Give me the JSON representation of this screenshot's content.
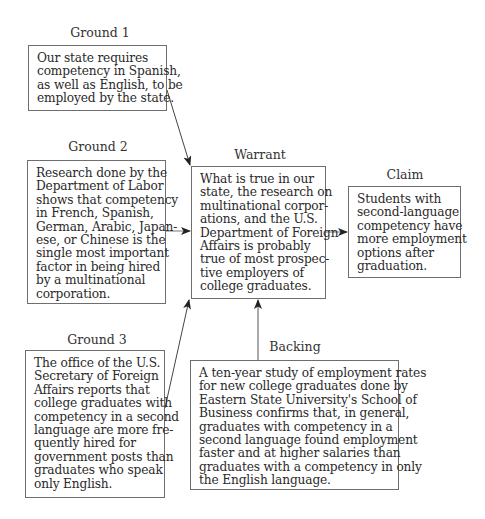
{
  "diagram": {
    "ground1": {
      "label": "Ground 1",
      "lines": [
        "Our state requires",
        "competency in Spanish,",
        "as well as English, to be",
        "employed by the state."
      ]
    },
    "ground2": {
      "label": "Ground 2",
      "lines": [
        "Research done by the",
        "Department of Labor",
        "shows that competency",
        "in French, Spanish,",
        "German, Arabic, Japan-",
        "ese, or Chinese is the",
        "single most important",
        "factor in being hired",
        "by a multinational",
        "corporation."
      ]
    },
    "ground3": {
      "label": "Ground 3",
      "lines": [
        "The office of the U.S.",
        "Secretary of Foreign",
        "Affairs reports that",
        "college graduates with",
        "competency in a second",
        "language are more fre-",
        "quently hired for",
        "government posts than",
        "graduates who speak",
        "only English."
      ]
    },
    "warrant": {
      "label": "Warrant",
      "lines": [
        "What is true in our",
        "state, the research on",
        "multinational corpor-",
        "ations, and the U.S.",
        "Department of Foreign",
        "Affairs is probably",
        "true of most prospec-",
        "tive employers of",
        "college graduates."
      ]
    },
    "claim": {
      "label": "Claim",
      "lines": [
        "Students with",
        "second-language",
        "competency have",
        "more employment",
        "options after",
        "graduation."
      ]
    },
    "backing": {
      "label": "Backing",
      "lines": [
        "A ten-year study of employment rates",
        "for new college graduates done by",
        "Eastern State University's School of",
        "Business confirms that, in general,",
        "graduates with competency in a",
        "second language found employment",
        "faster and at higher salaries than",
        "graduates with a competency in only",
        "the English language."
      ]
    },
    "arrows": [
      {
        "from": "ground1",
        "to": "warrant"
      },
      {
        "from": "ground2",
        "to": "warrant"
      },
      {
        "from": "ground3",
        "to": "warrant"
      },
      {
        "from": "backing",
        "to": "warrant"
      },
      {
        "from": "warrant",
        "to": "claim"
      }
    ],
    "colors": {
      "border": "#6e6e6e",
      "text": "#2a2a2a",
      "arrow": "#333333"
    }
  }
}
